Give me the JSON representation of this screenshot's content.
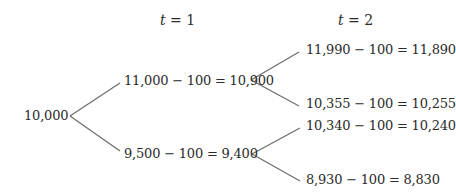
{
  "headers": {
    "t1": {
      "var": "t",
      "rest": " = 1"
    },
    "t2": {
      "var": "t",
      "rest": " = 2"
    }
  },
  "nodes": {
    "root": "10,000",
    "t1_up": "11,000 − 100 = 10,900",
    "t1_down": "9,500 − 100 = 9,400",
    "t2_up_up": "11,990 − 100 = 11,890",
    "t2_up_down": "10,355 − 100 = 10,255",
    "t2_down_up": "10,340 − 100 = 10,240",
    "t2_down_down": "8,930 − 100 = 8,830"
  },
  "colors": {
    "line": "#6b6b6b",
    "text": "#2a2a2a"
  }
}
